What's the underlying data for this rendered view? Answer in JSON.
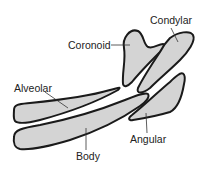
{
  "diagram": {
    "colors": {
      "fill": "#d4d4d4",
      "stroke": "#1a1a1a",
      "background": "#ffffff"
    },
    "labels": {
      "coronoid": "Coronoid",
      "condylar": "Condylar",
      "alveolar": "Alveolar",
      "body": "Body",
      "angular": "Angular"
    }
  }
}
